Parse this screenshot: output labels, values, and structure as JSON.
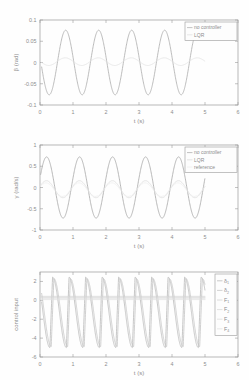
{
  "figure": {
    "background": "#fefefe",
    "axis_color": "#9a9a9a",
    "text_color": "#8d8d8d"
  },
  "chart_data": [
    {
      "id": "beta",
      "type": "line",
      "title": "",
      "xlabel": "t (s)",
      "ylabel": "β (rad)",
      "xlim": [
        0,
        6
      ],
      "ylim": [
        -0.1,
        0.1
      ],
      "xticks": [
        0,
        1,
        2,
        3,
        4,
        5,
        6
      ],
      "xtick_labels": [
        "0",
        "1",
        "2",
        "3",
        "4",
        "5",
        "6"
      ],
      "yticks": [
        -0.1,
        -0.05,
        0,
        0.05,
        0.1
      ],
      "ytick_labels": [
        "-0.1",
        "-0.05",
        "0",
        "0.05",
        "0.1"
      ],
      "grid": false,
      "legend_position": "top-right",
      "series": [
        {
          "name": "no controller",
          "color": "#b4b4b4",
          "width": 0.9,
          "kind": "sine",
          "amplitude": 0.076,
          "frequency": 1.0,
          "phase_deg": 170,
          "offset": 0.0,
          "x_start": 0.05,
          "x_end": 4.75
        },
        {
          "name": "LQR",
          "color": "#e2e2e2",
          "width": 0.8,
          "kind": "sine",
          "amplitude": 0.009,
          "frequency": 1.0,
          "phase_deg": 175,
          "offset": 0.002,
          "x_start": 0.05,
          "x_end": 5.0
        }
      ]
    },
    {
      "id": "gamma",
      "type": "line",
      "title": "",
      "xlabel": "t (s)",
      "ylabel": "γ (rad/s)",
      "xlim": [
        0,
        6
      ],
      "ylim": [
        -1,
        1
      ],
      "xticks": [
        0,
        1,
        2,
        3,
        4,
        5,
        6
      ],
      "xtick_labels": [
        "0",
        "1",
        "2",
        "3",
        "4",
        "5",
        "6"
      ],
      "yticks": [
        -1,
        -0.5,
        0,
        0.5,
        1
      ],
      "ytick_labels": [
        "-1",
        "-0.5",
        "0",
        "0.5",
        "1"
      ],
      "grid": false,
      "legend_position": "top-right",
      "series": [
        {
          "name": "no controller",
          "color": "#b0b0b0",
          "width": 0.9,
          "kind": "sine",
          "amplitude": 0.72,
          "frequency": 1.0,
          "phase_deg": 18,
          "offset": 0.0,
          "x_start": 0.02,
          "x_end": 5.0
        },
        {
          "name": "LQR",
          "color": "#dcdcdc",
          "width": 0.8,
          "kind": "sine",
          "amplitude": 0.2,
          "frequency": 1.0,
          "phase_deg": 20,
          "offset": -0.04,
          "x_start": 0.02,
          "x_end": 5.0
        },
        {
          "name": "reference",
          "color": "#ececec",
          "width": 0.7,
          "kind": "sine",
          "amplitude": 0.16,
          "frequency": 1.0,
          "phase_deg": 25,
          "offset": -0.05,
          "x_start": 0.02,
          "x_end": 5.0
        }
      ]
    },
    {
      "id": "control_input",
      "type": "line",
      "title": "",
      "xlabel": "t (s)",
      "ylabel": "control input",
      "xlim": [
        0,
        6
      ],
      "ylim": [
        -6,
        3
      ],
      "xticks": [
        0,
        1,
        2,
        3,
        4,
        5,
        6
      ],
      "xtick_labels": [
        "0",
        "1",
        "2",
        "3",
        "4",
        "5",
        "6"
      ],
      "yticks": [
        -6,
        -4,
        -2,
        0,
        2
      ],
      "ytick_labels": [
        "-6",
        "-4",
        "-2",
        "0",
        "2"
      ],
      "grid": false,
      "legend_position": "right",
      "series": [
        {
          "name": "δ",
          "subscript": "1",
          "color": "#bdbdbd",
          "width": 0.85,
          "kind": "spike",
          "amplitude": 2.45,
          "trough": -5.0,
          "period": 0.5,
          "phase": 0.38,
          "x_start": 0.05,
          "x_end": 5.0
        },
        {
          "name": "δ",
          "subscript": "2",
          "color": "#c7c7c7",
          "width": 0.85,
          "kind": "spike",
          "amplitude": 2.3,
          "trough": -4.9,
          "period": 0.5,
          "phase": 0.42,
          "x_start": 0.05,
          "x_end": 5.0
        },
        {
          "name": "F",
          "subscript": "1",
          "color": "#d3d3d3",
          "width": 0.7,
          "kind": "flat",
          "level": 0.42,
          "x_start": 0.02,
          "x_end": 5.0
        },
        {
          "name": "F",
          "subscript": "2",
          "color": "#d9d9d9",
          "width": 0.7,
          "kind": "flat",
          "level": 0.3,
          "x_start": 0.02,
          "x_end": 5.0
        },
        {
          "name": "F",
          "subscript": "3",
          "color": "#dedede",
          "width": 0.7,
          "kind": "flat",
          "level": 0.18,
          "x_start": 0.02,
          "x_end": 5.0
        },
        {
          "name": "F",
          "subscript": "4",
          "color": "#e3e3e3",
          "width": 0.7,
          "kind": "flat",
          "level": 0.08,
          "x_start": 0.02,
          "x_end": 5.0
        }
      ]
    }
  ]
}
